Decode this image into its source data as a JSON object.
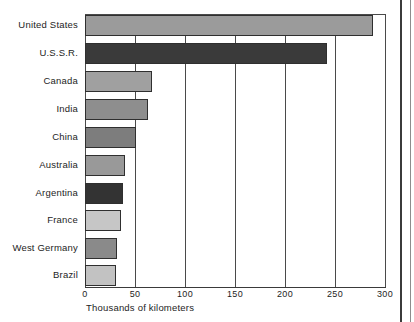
{
  "chart_data": {
    "type": "bar",
    "orientation": "horizontal",
    "title": "",
    "subtitle": "",
    "xlabel": "Thousands of kilometers",
    "ylabel": "",
    "categories": [
      "United States",
      "U.S.S.R.",
      "Canada",
      "India",
      "China",
      "Australia",
      "Argentina",
      "France",
      "West Germany",
      "Brazil"
    ],
    "values": [
      288,
      242,
      67,
      63,
      51,
      40,
      38,
      36,
      32,
      31
    ],
    "bar_colors": [
      "#9b9b9b",
      "#3a3a3a",
      "#a0a0a0",
      "#8e8e8e",
      "#7d7d7d",
      "#999999",
      "#333333",
      "#c6c6c6",
      "#8a8a8a",
      "#c2c2c2"
    ],
    "bar_border_color": "#2f2f2f",
    "xlim": [
      0,
      300
    ],
    "xticks": [
      0,
      50,
      100,
      150,
      200,
      250,
      300
    ],
    "xtick_labels": [
      "0",
      "50",
      "100",
      "150",
      "200",
      "250",
      "300"
    ],
    "grid": true,
    "grid_axis": "x",
    "grid_color": "#4a4a4a",
    "legend": false,
    "background": "#ffffff"
  }
}
